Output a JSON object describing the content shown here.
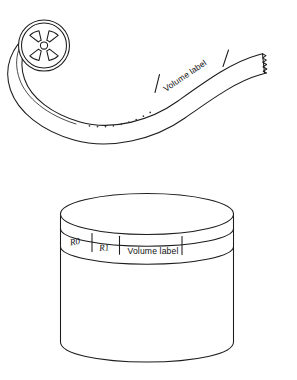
{
  "figure": {
    "background_color": "#ffffff",
    "line_color": "#1c1c1c",
    "width": 297,
    "height": 380
  },
  "tape_reel": {
    "name": "magnetic-tape-reel",
    "hub_spoke_count": 4,
    "tape_segments": [
      {
        "id": "leading-blank",
        "label": ""
      },
      {
        "id": "volume-label",
        "label": "Volume label"
      },
      {
        "id": "trailing-blank",
        "label": ""
      }
    ],
    "volume_label_text": "Volume label",
    "ellipsis_dot_count": 9,
    "end_style": "torn-edge"
  },
  "disk_pack": {
    "name": "disk-pack-cylinder",
    "band_cells": [
      {
        "id": "r0",
        "label": "R0",
        "style": "italic"
      },
      {
        "id": "r1",
        "label": "R1",
        "style": "italic"
      },
      {
        "id": "volume-label",
        "label": "Volume label",
        "style": "normal"
      },
      {
        "id": "blank",
        "label": "",
        "style": "normal"
      }
    ]
  }
}
